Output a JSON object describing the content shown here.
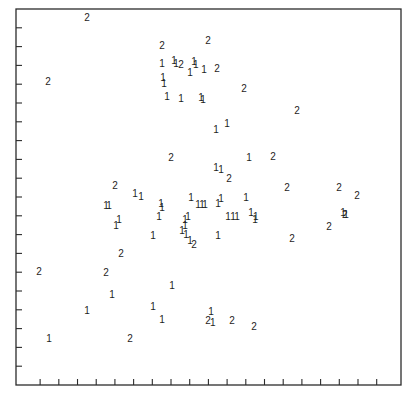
{
  "chart_data": {
    "type": "scatter",
    "title": "",
    "xlabel": "",
    "ylabel": "",
    "xlim": [
      -0.29,
      20.3
    ],
    "ylim": [
      0,
      20
    ],
    "x_ticks": [
      1,
      2,
      3,
      4,
      5,
      6,
      7,
      8,
      9,
      10,
      11,
      12,
      13,
      14,
      15,
      16,
      17,
      18,
      19
    ],
    "y_ticks": [
      1,
      2,
      3,
      4,
      5,
      6,
      7,
      8,
      9,
      10,
      11,
      12,
      13,
      14,
      15,
      16,
      17,
      18,
      19
    ],
    "tick_labels_shown": false,
    "grid": false,
    "legend": "none",
    "marker_style": "class label digits",
    "series": [
      {
        "name": "1",
        "marker": "1",
        "points": [
          [
            7.52,
            17.09
          ],
          [
            8.16,
            17.25
          ],
          [
            8.27,
            17.09
          ],
          [
            9.23,
            17.2
          ],
          [
            9.33,
            17.04
          ],
          [
            9.76,
            16.77
          ],
          [
            9.02,
            16.61
          ],
          [
            7.57,
            16.34
          ],
          [
            7.63,
            16.02
          ],
          [
            7.79,
            15.33
          ],
          [
            8.54,
            15.22
          ],
          [
            9.6,
            15.28
          ],
          [
            9.71,
            15.17
          ],
          [
            10.41,
            13.57
          ],
          [
            11.0,
            13.89
          ],
          [
            12.17,
            12.08
          ],
          [
            10.41,
            11.55
          ],
          [
            10.67,
            11.44
          ],
          [
            6.07,
            10.21
          ],
          [
            6.4,
            10.05
          ],
          [
            4.52,
            9.57
          ],
          [
            4.68,
            9.57
          ],
          [
            7.47,
            9.68
          ],
          [
            7.52,
            9.46
          ],
          [
            9.07,
            10.0
          ],
          [
            9.44,
            9.62
          ],
          [
            9.66,
            9.62
          ],
          [
            9.82,
            9.62
          ],
          [
            10.51,
            9.68
          ],
          [
            10.67,
            9.94
          ],
          [
            12.01,
            9.99
          ],
          [
            7.36,
            8.96
          ],
          [
            5.22,
            8.8
          ],
          [
            5.06,
            8.48
          ],
          [
            8.91,
            8.96
          ],
          [
            8.75,
            8.8
          ],
          [
            8.75,
            8.48
          ],
          [
            8.59,
            8.21
          ],
          [
            8.8,
            8.0
          ],
          [
            9.02,
            7.68
          ],
          [
            11.05,
            8.96
          ],
          [
            11.32,
            8.96
          ],
          [
            11.53,
            8.96
          ],
          [
            12.28,
            9.17
          ],
          [
            12.54,
            8.96
          ],
          [
            12.49,
            8.8
          ],
          [
            7.04,
            7.97
          ],
          [
            10.51,
            7.97
          ],
          [
            17.2,
            9.17
          ],
          [
            17.36,
            9.06
          ],
          [
            8.05,
            5.3
          ],
          [
            4.84,
            4.82
          ],
          [
            3.51,
            3.97
          ],
          [
            7.04,
            4.18
          ],
          [
            7.52,
            3.48
          ],
          [
            10.14,
            3.9
          ],
          [
            10.24,
            3.31
          ],
          [
            1.48,
            2.47
          ]
        ]
      },
      {
        "name": "2",
        "marker": "2",
        "points": [
          [
            3.51,
            19.54
          ],
          [
            7.52,
            18.05
          ],
          [
            9.98,
            18.31
          ],
          [
            1.42,
            16.13
          ],
          [
            8.53,
            17.04
          ],
          [
            10.46,
            16.82
          ],
          [
            11.9,
            15.75
          ],
          [
            14.74,
            14.58
          ],
          [
            8.0,
            12.08
          ],
          [
            13.45,
            12.13
          ],
          [
            11.1,
            11.01
          ],
          [
            14.2,
            10.53
          ],
          [
            16.98,
            10.53
          ],
          [
            17.95,
            10.1
          ],
          [
            5.01,
            10.63
          ],
          [
            16.45,
            8.448
          ],
          [
            14.47,
            7.81
          ],
          [
            9.23,
            7.49
          ],
          [
            5.33,
            7.01
          ],
          [
            0.94,
            6.05
          ],
          [
            4.52,
            6.0
          ],
          [
            5.81,
            2.47
          ],
          [
            9.98,
            3.44
          ],
          [
            11.26,
            3.44
          ],
          [
            12.44,
            3.12
          ],
          [
            17.3,
            9.06
          ]
        ]
      }
    ]
  }
}
